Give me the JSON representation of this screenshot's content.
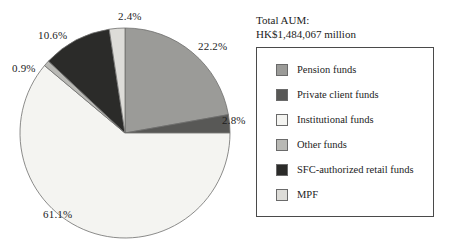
{
  "figure": {
    "aum_label": "Total AUM:",
    "aum_value": "HK$1,484,067 million"
  },
  "legend": {
    "items": [
      {
        "label": "Pension funds",
        "color": "#9b9b98",
        "swatch": "legend-swatch-pension"
      },
      {
        "label": "Private client funds",
        "color": "#585856",
        "swatch": "legend-swatch-private-client"
      },
      {
        "label": "Institutional funds",
        "color": "#f4f4f1",
        "swatch": "legend-swatch-institutional"
      },
      {
        "label": "Other funds",
        "color": "#b9b9b5",
        "swatch": "legend-swatch-other"
      },
      {
        "label": "SFC-authorized retail funds",
        "color": "#2b2b29",
        "swatch": "legend-swatch-sfc-retail"
      },
      {
        "label": "MPF",
        "color": "#dddcd8",
        "swatch": "legend-swatch-mpf"
      }
    ]
  },
  "chart_data": {
    "type": "pie",
    "title": "Total AUM: HK$1,484,067 million",
    "total_label": "HK$1,484,067 million",
    "unit": "percent",
    "start_angle_deg": 0,
    "direction": "clockwise",
    "legend_position": "right",
    "grid": false,
    "categories": [
      "Pension funds",
      "Private client funds",
      "Institutional funds",
      "Other funds",
      "SFC-authorized retail funds",
      "MPF"
    ],
    "values": [
      22.2,
      2.8,
      61.1,
      0.9,
      10.6,
      2.4
    ],
    "value_labels": [
      "22.2%",
      "2.8%",
      "61.1%",
      "0.9%",
      "10.6%",
      "2.4%"
    ],
    "colors": [
      "#9b9b98",
      "#585856",
      "#f4f4f1",
      "#b9b9b5",
      "#2b2b29",
      "#dddcd8"
    ],
    "slices": [
      {
        "name": "Pension funds",
        "value": 22.2,
        "label": "22.2%",
        "color": "#9b9b98"
      },
      {
        "name": "Private client funds",
        "value": 2.8,
        "label": "2.8%",
        "color": "#585856"
      },
      {
        "name": "Institutional funds",
        "value": 61.1,
        "label": "61.1%",
        "color": "#f4f4f1"
      },
      {
        "name": "Other funds",
        "value": 0.9,
        "label": "0.9%",
        "color": "#b9b9b5"
      },
      {
        "name": "SFC-authorized retail funds",
        "value": 10.6,
        "label": "10.6%",
        "color": "#2b2b29"
      },
      {
        "name": "MPF",
        "value": 2.4,
        "label": "2.4%",
        "color": "#dddcd8"
      }
    ]
  }
}
